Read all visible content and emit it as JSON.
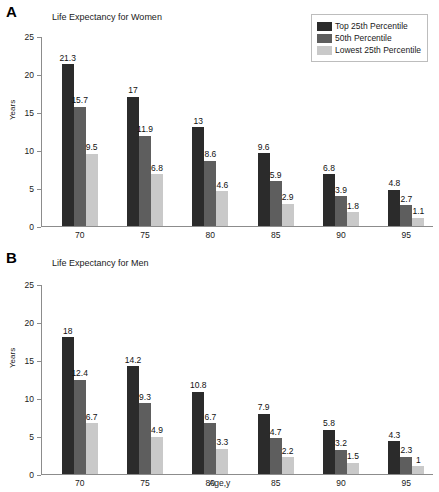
{
  "figure": {
    "panel_a_letter": "A",
    "panel_b_letter": "B"
  },
  "legend": {
    "entries": [
      {
        "label": "Top 25th Percentile",
        "color": "#2b2b2b"
      },
      {
        "label": "50th Percentile",
        "color": "#5e5e5e"
      },
      {
        "label": "Lowest 25th Percentile",
        "color": "#c9c9c9"
      }
    ]
  },
  "chart_data": [
    {
      "type": "bar",
      "panel": "A",
      "title": "Life Expectancy for Women",
      "xlabel": "",
      "ylabel": "Years",
      "categories": [
        "70",
        "75",
        "80",
        "85",
        "90",
        "95"
      ],
      "ylim": [
        0,
        25
      ],
      "yticks": [
        0,
        5,
        10,
        15,
        20,
        25
      ],
      "ytick_labels": [
        "0",
        "5",
        "10",
        "15",
        "20",
        "25"
      ],
      "grid": false,
      "legend_position": "top-right",
      "series": [
        {
          "name": "Top 25th Percentile",
          "color": "#2b2b2b",
          "values": [
            21.3,
            17,
            13,
            9.6,
            6.8,
            4.8
          ],
          "labels": [
            "21.3",
            "17",
            "13",
            "9.6",
            "6.8",
            "4.8"
          ]
        },
        {
          "name": "50th Percentile",
          "color": "#5e5e5e",
          "values": [
            15.7,
            11.9,
            8.6,
            5.9,
            3.9,
            2.7
          ],
          "labels": [
            "15.7",
            "11.9",
            "8.6",
            "5.9",
            "3.9",
            "2.7"
          ]
        },
        {
          "name": "Lowest 25th Percentile",
          "color": "#c9c9c9",
          "values": [
            9.5,
            6.8,
            4.6,
            2.9,
            1.8,
            1.1
          ],
          "labels": [
            "9.5",
            "6.8",
            "4.6",
            "2.9",
            "1.8",
            "1.1"
          ]
        }
      ]
    },
    {
      "type": "bar",
      "panel": "B",
      "title": "Life Expectancy for Men",
      "xlabel": "Age,y",
      "ylabel": "Years",
      "categories": [
        "70",
        "75",
        "80",
        "85",
        "90",
        "95"
      ],
      "ylim": [
        0,
        25
      ],
      "yticks": [
        0,
        5,
        10,
        15,
        20,
        25
      ],
      "ytick_labels": [
        "0",
        "5",
        "10",
        "15",
        "20",
        "25"
      ],
      "grid": false,
      "legend_position": "none",
      "series": [
        {
          "name": "Top 25th Percentile",
          "color": "#2b2b2b",
          "values": [
            18,
            14.2,
            10.8,
            7.9,
            5.8,
            4.3
          ],
          "labels": [
            "18",
            "14.2",
            "10.8",
            "7.9",
            "5.8",
            "4.3"
          ]
        },
        {
          "name": "50th Percentile",
          "color": "#5e5e5e",
          "values": [
            12.4,
            9.3,
            6.7,
            4.7,
            3.2,
            2.3
          ],
          "labels": [
            "12.4",
            "9.3",
            "6.7",
            "4.7",
            "3.2",
            "2.3"
          ]
        },
        {
          "name": "Lowest 25th Percentile",
          "color": "#c9c9c9",
          "values": [
            6.7,
            4.9,
            3.3,
            2.2,
            1.5,
            1
          ],
          "labels": [
            "6.7",
            "4.9",
            "3.3",
            "2.2",
            "1.5",
            "1"
          ]
        }
      ]
    }
  ]
}
